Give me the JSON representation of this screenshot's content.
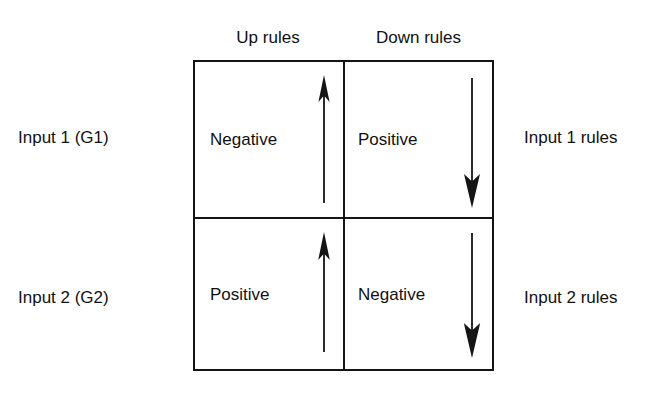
{
  "diagram": {
    "column_headers": [
      {
        "id": "up-rules",
        "label": "Up rules"
      },
      {
        "id": "down-rules",
        "label": "Down rules"
      }
    ],
    "left_labels": [
      {
        "id": "input-1-g1",
        "label": "Input 1 (G1)"
      },
      {
        "id": "input-2-g2",
        "label": "Input 2 (G2)"
      }
    ],
    "right_labels": [
      {
        "id": "input-1-rules",
        "label": "Input 1 rules"
      },
      {
        "id": "input-2-rules",
        "label": "Input 2 rules"
      }
    ],
    "cells": [
      {
        "id": "row1-col1",
        "row": "Input 1 (G1)",
        "column": "Up rules",
        "label": "Negative",
        "arrow": "up"
      },
      {
        "id": "row1-col2",
        "row": "Input 1 (G1)",
        "column": "Down rules",
        "label": "Positive",
        "arrow": "down"
      },
      {
        "id": "row2-col1",
        "row": "Input 2 (G2)",
        "column": "Up rules",
        "label": "Positive",
        "arrow": "up"
      },
      {
        "id": "row2-col2",
        "row": "Input 2 (G2)",
        "column": "Down rules",
        "label": "Negative",
        "arrow": "down"
      }
    ],
    "arrows": [
      {
        "id": "arrow-top-left",
        "direction": "up",
        "icon": "arrow-up-icon"
      },
      {
        "id": "arrow-top-right",
        "direction": "down",
        "icon": "arrow-down-icon"
      },
      {
        "id": "arrow-bottom-left",
        "direction": "up",
        "icon": "arrow-up-icon"
      },
      {
        "id": "arrow-bottom-right",
        "direction": "down",
        "icon": "arrow-down-icon"
      }
    ],
    "colors": {
      "line": "#141414",
      "text": "#111111",
      "background": "#ffffff"
    }
  }
}
